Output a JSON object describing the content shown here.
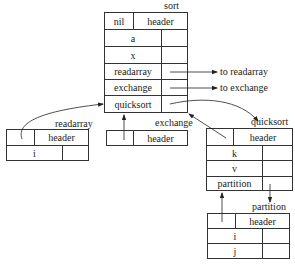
{
  "diagram": {
    "type": "symbol-table-tree",
    "records": {
      "sort": {
        "title": "sort",
        "header": {
          "left": "nil",
          "right": "header"
        },
        "entries": [
          "a",
          "x",
          "readarray",
          "exchange",
          "quicksort"
        ]
      },
      "readarray": {
        "title": "readarray",
        "header": {
          "left": "",
          "right": "header"
        },
        "entries": [
          "i"
        ]
      },
      "exchange": {
        "title": "exchange",
        "header": {
          "left": "",
          "right": "header"
        },
        "entries": []
      },
      "quicksort": {
        "title": "quicksort",
        "header": {
          "left": "",
          "right": "header"
        },
        "entries": [
          "k",
          "v",
          "partition"
        ]
      },
      "partition": {
        "title": "partition",
        "header": {
          "left": "",
          "right": "header"
        },
        "entries": [
          "i",
          "j"
        ]
      }
    },
    "annotations": {
      "to_readarray": "to readarray",
      "to_exchange": "to exchange"
    },
    "edges": [
      {
        "from": "sort.readarray",
        "to": "to readarray",
        "kind": "pointer"
      },
      {
        "from": "sort.exchange",
        "to": "to exchange",
        "kind": "pointer"
      },
      {
        "from": "sort.quicksort",
        "to": "quicksort",
        "kind": "pointer"
      },
      {
        "from": "readarray.header",
        "to": "sort",
        "kind": "parent-link"
      },
      {
        "from": "exchange.header",
        "to": "sort",
        "kind": "parent-link"
      },
      {
        "from": "quicksort.header",
        "to": "sort",
        "kind": "parent-link"
      },
      {
        "from": "quicksort.partition",
        "to": "partition",
        "kind": "pointer"
      },
      {
        "from": "partition.header",
        "to": "quicksort",
        "kind": "parent-link"
      }
    ]
  }
}
